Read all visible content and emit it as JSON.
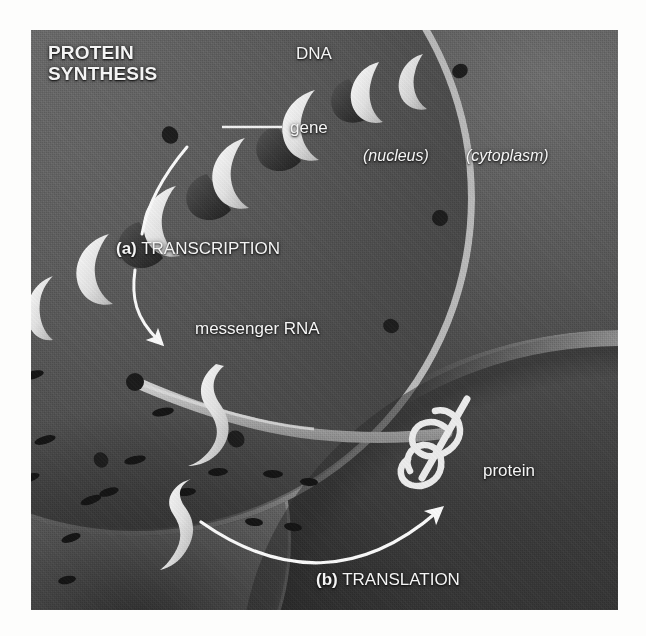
{
  "figure": {
    "title_line1": "PROTEIN",
    "title_line2": "SYNTHESIS"
  },
  "labels": {
    "dna": "DNA",
    "gene": "gene",
    "nucleus": "(nucleus)",
    "cytoplasm": "(cytoplasm)",
    "transcription_marker": "(a)",
    "transcription": "TRANSCRIPTION",
    "messenger_rna": "messenger RNA",
    "protein": "protein",
    "translation_marker": "(b)",
    "translation": "TRANSLATION"
  },
  "colors": {
    "label_text": "#f4f4f4",
    "membrane": "#b9b9b9",
    "ribbon_light": "#ededed",
    "ribbon_dark": "#3d3d3d",
    "arrow": "#fafafa",
    "cytoplasm_dark": "#3c3c3c",
    "nucleoplasm": "#646464",
    "page_background": "#ffffff"
  }
}
